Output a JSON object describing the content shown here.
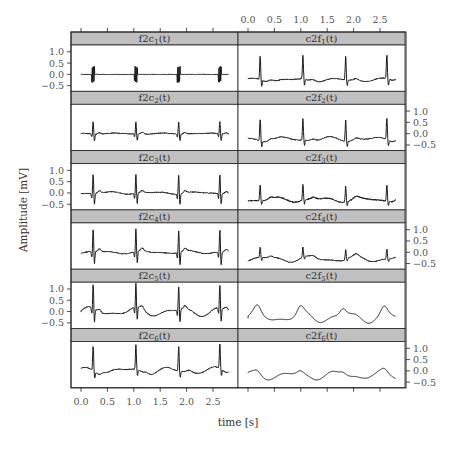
{
  "chart_data": {
    "type": "line",
    "layout": "trellis 6 rows x 2 columns",
    "xlabel": "time [s]",
    "ylabel": "Amplitude [mV]",
    "x_ticks": [
      0.0,
      0.5,
      1.0,
      1.5,
      2.0,
      2.5
    ],
    "x_tick_labels": [
      "0.0",
      "0.5",
      "1.0",
      "1.5",
      "2.0",
      "2.5"
    ],
    "y_ticks": [
      1.0,
      0.5,
      0.0,
      -0.5
    ],
    "y_tick_labels": [
      "1.0",
      "0.5",
      "0.0",
      "−0.5"
    ],
    "xlim": [
      -0.1,
      3.05
    ],
    "ylim": [
      -0.75,
      1.3
    ],
    "grid": false,
    "legend": "none",
    "strip_color": "#c0c0c0",
    "line_color": "#1a1a1a",
    "beat_times": [
      0.23,
      1.04,
      1.85,
      2.63
    ],
    "panels": [
      {
        "row": 0,
        "col": 0,
        "label": "f2c",
        "sub": "1",
        "style": "burst",
        "amp": 0.35,
        "baseline": 0.0,
        "noise": 0.015,
        "wave": 0.0
      },
      {
        "row": 0,
        "col": 1,
        "label": "c2f",
        "sub": "1",
        "style": "ecg",
        "amp": 1.05,
        "baseline": -0.25,
        "noise": 0.02,
        "wave": 0.06
      },
      {
        "row": 1,
        "col": 0,
        "label": "f2c",
        "sub": "2",
        "style": "ecg-sym",
        "amp": 0.55,
        "baseline": 0.0,
        "noise": 0.02,
        "wave": 0.02
      },
      {
        "row": 1,
        "col": 1,
        "label": "c2f",
        "sub": "2",
        "style": "ecg",
        "amp": 0.95,
        "baseline": -0.25,
        "noise": 0.02,
        "wave": 0.08
      },
      {
        "row": 2,
        "col": 0,
        "label": "f2c",
        "sub": "3",
        "style": "ecg-sym",
        "amp": 0.85,
        "baseline": 0.0,
        "noise": 0.02,
        "wave": 0.04
      },
      {
        "row": 2,
        "col": 1,
        "label": "c2f",
        "sub": "3",
        "style": "ecg",
        "amp": 0.7,
        "baseline": -0.3,
        "noise": 0.03,
        "wave": 0.08
      },
      {
        "row": 3,
        "col": 0,
        "label": "f2c",
        "sub": "4",
        "style": "ecg-sym",
        "amp": 1.0,
        "baseline": 0.0,
        "noise": 0.02,
        "wave": 0.05
      },
      {
        "row": 3,
        "col": 1,
        "label": "c2f",
        "sub": "4",
        "style": "ecg",
        "amp": 0.45,
        "baseline": -0.3,
        "noise": 0.02,
        "wave": 0.1
      },
      {
        "row": 4,
        "col": 0,
        "label": "f2c",
        "sub": "5",
        "style": "ecg-sym",
        "amp": 1.05,
        "baseline": 0.0,
        "noise": 0.02,
        "wave": 0.15
      },
      {
        "row": 4,
        "col": 1,
        "label": "c2f",
        "sub": "5",
        "style": "smooth",
        "amp": 0.3,
        "baseline": -0.25,
        "noise": 0.0,
        "wave": 0.18
      },
      {
        "row": 5,
        "col": 0,
        "label": "f2c",
        "sub": "6",
        "style": "ecg",
        "amp": 1.1,
        "baseline": 0.0,
        "noise": 0.02,
        "wave": 0.12
      },
      {
        "row": 5,
        "col": 1,
        "label": "c2f",
        "sub": "6",
        "style": "smooth",
        "amp": 0.12,
        "baseline": -0.2,
        "noise": 0.0,
        "wave": 0.14
      }
    ]
  }
}
